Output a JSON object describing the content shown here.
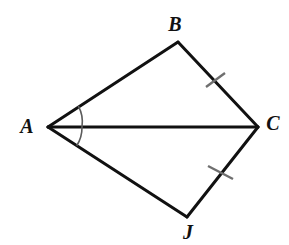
{
  "figure": {
    "type": "geometry-diagram",
    "width": 289,
    "height": 245,
    "background_color": "#ffffff",
    "stroke_color": "#111111",
    "tick_color": "#6f6f6f",
    "arc_color": "#5c5c5c"
  },
  "vertices": [
    {
      "id": "A",
      "label": "A",
      "x": 48,
      "y": 127,
      "label_x": 27,
      "label_y": 128
    },
    {
      "id": "B",
      "label": "B",
      "x": 178,
      "y": 42,
      "label_x": 175,
      "label_y": 26
    },
    {
      "id": "C",
      "label": "C",
      "x": 258,
      "y": 127,
      "label_x": 273,
      "label_y": 125
    },
    {
      "id": "J",
      "label": "J",
      "x": 187,
      "y": 217,
      "label_x": 188,
      "label_y": 234
    }
  ],
  "segments": [
    {
      "id": "AB",
      "from": "A",
      "to": "B",
      "x1": 48,
      "y1": 127,
      "x2": 178,
      "y2": 42,
      "width": 3
    },
    {
      "id": "BC",
      "from": "B",
      "to": "C",
      "x1": 178,
      "y1": 42,
      "x2": 258,
      "y2": 127,
      "width": 3
    },
    {
      "id": "AC",
      "from": "A",
      "to": "C",
      "x1": 48,
      "y1": 127,
      "x2": 258,
      "y2": 127,
      "width": 3
    },
    {
      "id": "AJ",
      "from": "A",
      "to": "J",
      "x1": 48,
      "y1": 127,
      "x2": 187,
      "y2": 217,
      "width": 3
    },
    {
      "id": "CJ",
      "from": "C",
      "to": "J",
      "x1": 258,
      "y1": 127,
      "x2": 187,
      "y2": 217,
      "width": 3
    }
  ],
  "tick_marks": [
    {
      "id": "tick-bc",
      "on_segment": "BC",
      "count": 1,
      "x1": 206,
      "y1": 87,
      "x2": 225,
      "y2": 73,
      "width": 2
    },
    {
      "id": "tick-cj",
      "on_segment": "CJ",
      "count": 1,
      "x1": 208,
      "y1": 166,
      "x2": 233,
      "y2": 179,
      "width": 2
    }
  ],
  "angle_marks": [
    {
      "id": "angle-bac",
      "vertex": "A",
      "rays": [
        "AB",
        "AC"
      ],
      "path": "M 78.3 105.9 A 34 34 0 0 1 82 127",
      "width": 1.6
    },
    {
      "id": "angle-caj",
      "vertex": "A",
      "rays": [
        "AC",
        "AJ"
      ],
      "path": "M 82 127 A 34 34 0 0 1 76.7 145.8",
      "width": 1.6
    }
  ],
  "congruence_notes": {
    "equal_sides": "BC = CJ",
    "equal_angles": "angle BAC = angle CAJ"
  }
}
